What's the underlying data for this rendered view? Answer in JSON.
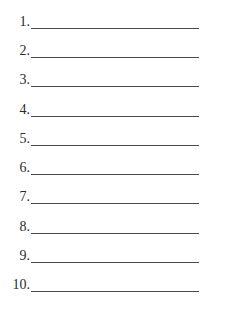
{
  "document": {
    "top_fragment": "",
    "list": {
      "items": [
        {
          "number": "1.",
          "value": ""
        },
        {
          "number": "2.",
          "value": ""
        },
        {
          "number": "3.",
          "value": ""
        },
        {
          "number": "4.",
          "value": ""
        },
        {
          "number": "5.",
          "value": ""
        },
        {
          "number": "6.",
          "value": ""
        },
        {
          "number": "7.",
          "value": ""
        },
        {
          "number": "8.",
          "value": ""
        },
        {
          "number": "9.",
          "value": ""
        },
        {
          "number": "10.",
          "value": ""
        }
      ]
    },
    "colors": {
      "text": "#2b2b2b",
      "rule": "#4a4a4a",
      "background": "#ffffff"
    }
  }
}
